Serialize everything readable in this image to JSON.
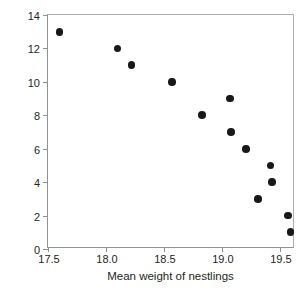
{
  "chart_data": {
    "type": "scatter",
    "title": "",
    "xlabel": "Mean weight of nestlings",
    "ylabel": "Number of young in brood",
    "xlim": [
      17.5,
      19.63
    ],
    "ylim": [
      0,
      14
    ],
    "xticks": [
      "17.5",
      "18.0",
      "18.5",
      "19.0",
      "19.5"
    ],
    "xtick_values": [
      17.5,
      18.0,
      18.5,
      19.0,
      19.5
    ],
    "yticks": [
      "0",
      "2",
      "4",
      "6",
      "8",
      "10",
      "12",
      "14"
    ],
    "ytick_values": [
      0,
      2,
      4,
      6,
      8,
      10,
      12,
      14
    ],
    "grid": false,
    "legend": null,
    "marker": {
      "shape": "circle",
      "color": "#17181a",
      "size_px": 7.6
    },
    "axis_color": "#8d9593",
    "background": "#ffffff",
    "points": [
      {
        "x": 17.6,
        "y": 13
      },
      {
        "x": 18.1,
        "y": 12
      },
      {
        "x": 18.22,
        "y": 11
      },
      {
        "x": 18.57,
        "y": 10
      },
      {
        "x": 19.07,
        "y": 9
      },
      {
        "x": 18.83,
        "y": 8
      },
      {
        "x": 19.08,
        "y": 7
      },
      {
        "x": 19.21,
        "y": 6
      },
      {
        "x": 19.42,
        "y": 5
      },
      {
        "x": 19.43,
        "y": 4
      },
      {
        "x": 19.31,
        "y": 3
      },
      {
        "x": 19.57,
        "y": 2
      },
      {
        "x": 19.59,
        "y": 1
      }
    ]
  }
}
